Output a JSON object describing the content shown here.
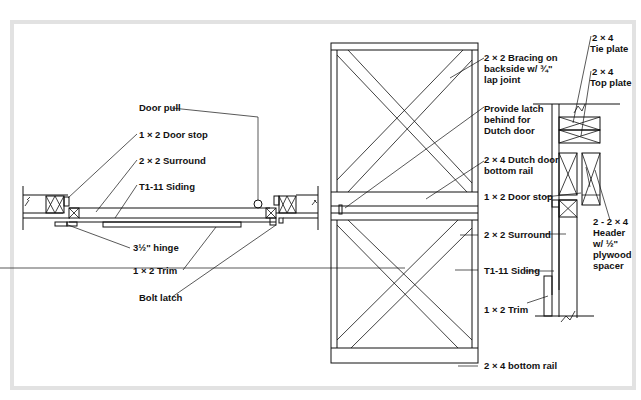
{
  "figure": {
    "type": "construction-detail",
    "views": [
      "plan-section",
      "elevation",
      "side-section"
    ]
  },
  "plan_section": {
    "labels": {
      "door_pull": "Door pull",
      "door_stop": "1 × 2 Door stop",
      "surround": "2 × 2 Surround",
      "siding": "T1-11 Siding",
      "hinge": "3½\" hinge",
      "trim": "1 × 2 Trim",
      "bolt_latch": "Bolt latch"
    }
  },
  "elevation": {
    "labels": {
      "bracing_1": "2 × 2 Bracing on",
      "bracing_2": "backside w/ ¾\"",
      "bracing_3": "lap joint",
      "latch_1": "Provide latch",
      "latch_2": "behind for",
      "latch_3": "Dutch door",
      "dutch_rail_1": "2 × 4 Dutch door",
      "dutch_rail_2": "bottom rail",
      "door_stop": "1 × 2 Door stop",
      "surround": "2 × 2 Surround",
      "siding": "T1-11 Siding",
      "trim": "1 × 2 Trim",
      "bottom_rail": "2 × 4 bottom rail"
    }
  },
  "side_section": {
    "labels": {
      "tie_plate_1": "2 × 4",
      "tie_plate_2": "Tie plate",
      "top_plate_1": "2 × 4",
      "top_plate_2": "Top plate",
      "header_1": "2 - 2 × 4",
      "header_2": "Header",
      "header_3": "w/ ½\"",
      "header_4": "plywood",
      "header_5": "spacer"
    }
  },
  "colors": {
    "line": "#111111",
    "frame": "#e2e2e2",
    "background": "#ffffff"
  }
}
